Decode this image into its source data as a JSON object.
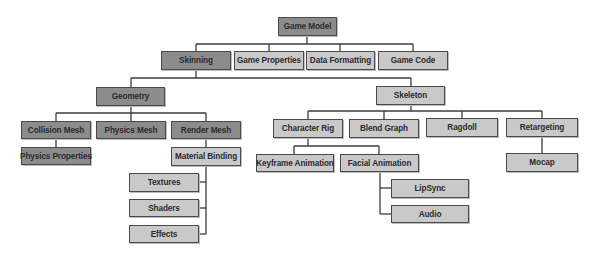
{
  "diagram": {
    "colors": {
      "dark_node": "#8c8c8c",
      "light_node": "#c9c9c9",
      "border": "#4a4a4a",
      "line": "#3c3c3c"
    },
    "nodes": {
      "game_model": "Game Model",
      "skinning": "Skinning",
      "game_properties": "Game Properties",
      "data_formatting": "Data Formatting",
      "game_code": "Game Code",
      "geometry": "Geometry",
      "skeleton": "Skeleton",
      "collision_mesh": "Collision Mesh",
      "physics_mesh": "Physics Mesh",
      "render_mesh": "Render Mesh",
      "physics_properties": "Physics Properties",
      "material_binding": "Material Binding",
      "textures": "Textures",
      "shaders": "Shaders",
      "effects": "Effects",
      "character_rig": "Character Rig",
      "blend_graph": "Blend Graph",
      "ragdoll": "Ragdoll",
      "retargeting": "Retargeting",
      "keyframe_animation": "Keyframe Animation",
      "facial_animation": "Facial Animation",
      "mocap": "Mocap",
      "lipsync": "LipSync",
      "audio": "Audio"
    },
    "edges": [
      [
        "Game Model",
        "Skinning"
      ],
      [
        "Game Model",
        "Game Properties"
      ],
      [
        "Game Model",
        "Data Formatting"
      ],
      [
        "Game Model",
        "Game Code"
      ],
      [
        "Skinning",
        "Geometry"
      ],
      [
        "Skinning",
        "Skeleton"
      ],
      [
        "Geometry",
        "Collision Mesh"
      ],
      [
        "Geometry",
        "Physics Mesh"
      ],
      [
        "Geometry",
        "Render Mesh"
      ],
      [
        "Collision Mesh",
        "Physics Properties"
      ],
      [
        "Render Mesh",
        "Material Binding"
      ],
      [
        "Material Binding",
        "Textures"
      ],
      [
        "Material Binding",
        "Shaders"
      ],
      [
        "Material Binding",
        "Effects"
      ],
      [
        "Skeleton",
        "Character Rig"
      ],
      [
        "Skeleton",
        "Blend Graph"
      ],
      [
        "Skeleton",
        "Ragdoll"
      ],
      [
        "Skeleton",
        "Retargeting"
      ],
      [
        "Character Rig",
        "Keyframe Animation"
      ],
      [
        "Character Rig",
        "Facial Animation"
      ],
      [
        "Facial Animation",
        "LipSync"
      ],
      [
        "Facial Animation",
        "Audio"
      ],
      [
        "Retargeting",
        "Mocap"
      ]
    ]
  }
}
